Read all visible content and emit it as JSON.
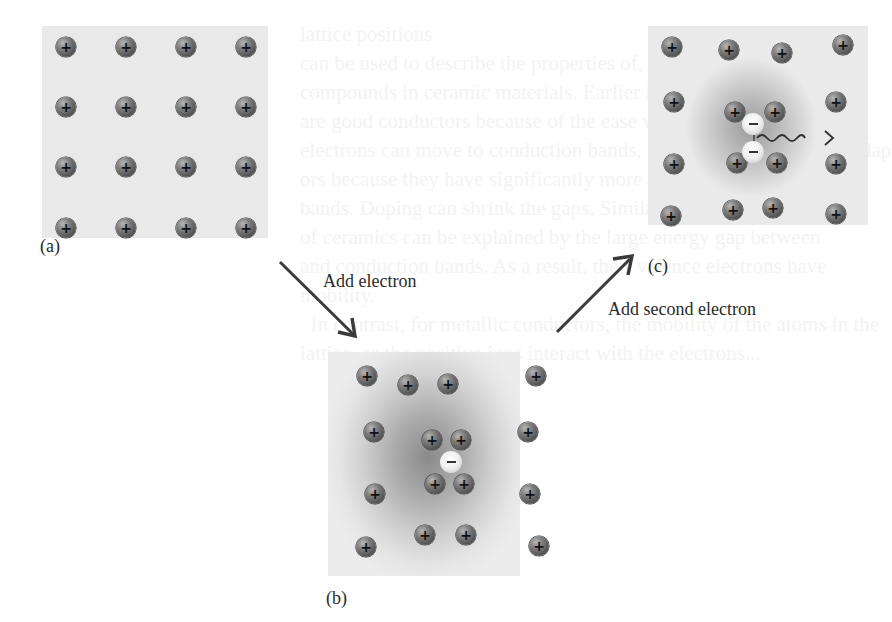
{
  "figure": {
    "panels": [
      {
        "id": "a",
        "label": "(a)",
        "description": "Regular lattice of positive ions",
        "ions": [
          [
            66,
            47
          ],
          [
            126,
            47
          ],
          [
            186,
            47
          ],
          [
            246,
            47
          ],
          [
            66,
            107
          ],
          [
            126,
            107
          ],
          [
            186,
            107
          ],
          [
            246,
            107
          ],
          [
            66,
            167
          ],
          [
            126,
            167
          ],
          [
            186,
            167
          ],
          [
            246,
            167
          ],
          [
            66,
            228
          ],
          [
            126,
            228
          ],
          [
            186,
            228
          ],
          [
            246,
            228
          ]
        ],
        "electrons": []
      },
      {
        "id": "b",
        "label": "(b)",
        "description": "One electron distorts lattice, attracting nearby ions",
        "ions": [
          [
            367,
            376
          ],
          [
            408,
            385
          ],
          [
            448,
            384
          ],
          [
            536,
            376
          ],
          [
            374,
            432
          ],
          [
            432,
            440
          ],
          [
            461,
            440
          ],
          [
            528,
            432
          ],
          [
            375,
            494
          ],
          [
            435,
            484
          ],
          [
            464,
            484
          ],
          [
            530,
            494
          ],
          [
            366,
            547
          ],
          [
            425,
            535
          ],
          [
            466,
            535
          ],
          [
            539,
            546
          ]
        ],
        "electrons": [
          [
            451,
            462
          ]
        ]
      },
      {
        "id": "c",
        "label": "(c)",
        "description": "Second electron attracted to distorted region, forming a pair",
        "ions": [
          [
            672,
            47
          ],
          [
            729,
            50
          ],
          [
            782,
            53
          ],
          [
            843,
            45
          ],
          [
            674,
            102
          ],
          [
            735,
            112
          ],
          [
            775,
            112
          ],
          [
            836,
            102
          ],
          [
            674,
            164
          ],
          [
            737,
            163
          ],
          [
            777,
            163
          ],
          [
            836,
            164
          ],
          [
            671,
            216
          ],
          [
            733,
            210
          ],
          [
            773,
            208
          ],
          [
            836,
            214
          ]
        ],
        "electrons": [
          [
            753,
            124
          ],
          [
            753,
            152
          ]
        ],
        "wavy_arrow": true
      }
    ],
    "transitions": [
      {
        "label": "Add electron",
        "from": "a",
        "to": "b"
      },
      {
        "label": "Add second electron",
        "from": "b",
        "to": "c"
      }
    ],
    "ion_symbol": "+",
    "electron_symbol": "−"
  },
  "background_text": "lattice positions\ncan be used to describe the properties of, and bonding in, all\ncompounds in ceramic materials. Earlier in the chapter\nare good conductors because of the ease with which\nelectrons can move to conduction bands, whereas semimetals are adapt\nors because they have significantly more gaps between the\nbands. Doping can shrink the gaps. Similarly, the insulating\nof ceramics can be explained by the large energy gap between\nand conduction bands. As a result, their valence electrons have\nmobility.\n  In contrast, for metallic conductors, the mobility of the atoms in the\nlattice, as the positive ions interact with the electrons..."
}
